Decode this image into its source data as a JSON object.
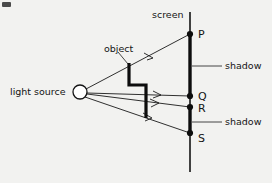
{
  "diagram": {
    "labels": {
      "light_source": "light source",
      "object": "object",
      "screen": "screen",
      "shadow_upper": "shadow",
      "shadow_lower": "shadow"
    },
    "points": [
      {
        "id": "P",
        "label": "P",
        "x": 190,
        "y": 34
      },
      {
        "id": "Q",
        "label": "Q",
        "x": 190,
        "y": 96
      },
      {
        "id": "R",
        "label": "R",
        "x": 190,
        "y": 107
      },
      {
        "id": "S",
        "label": "S",
        "x": 190,
        "y": 133
      }
    ],
    "light_source_position": {
      "x": 80,
      "y": 92,
      "radius": 7
    },
    "screen": {
      "x": 190,
      "y_top": 12,
      "y_bottom": 172
    },
    "shadow_regions": [
      {
        "name": "upper-shadow",
        "from_point": "P",
        "to_point": "Q",
        "y_start": 34,
        "y_end": 96
      },
      {
        "name": "lower-shadow",
        "from_point": "R",
        "to_point": "S",
        "y_start": 107,
        "y_end": 133
      }
    ],
    "rays": [
      {
        "name": "ray-to-P",
        "from": "light source",
        "to": "P"
      },
      {
        "name": "ray-to-Q",
        "from": "light source",
        "to": "Q"
      },
      {
        "name": "ray-to-R",
        "from": "light source",
        "to": "R"
      },
      {
        "name": "ray-to-S",
        "from": "light source",
        "to": "S"
      }
    ],
    "object_shape": "step",
    "colors": {
      "ink": "#141414",
      "paper": "#f2f2f0",
      "shadow": "#0d0d0d"
    }
  }
}
